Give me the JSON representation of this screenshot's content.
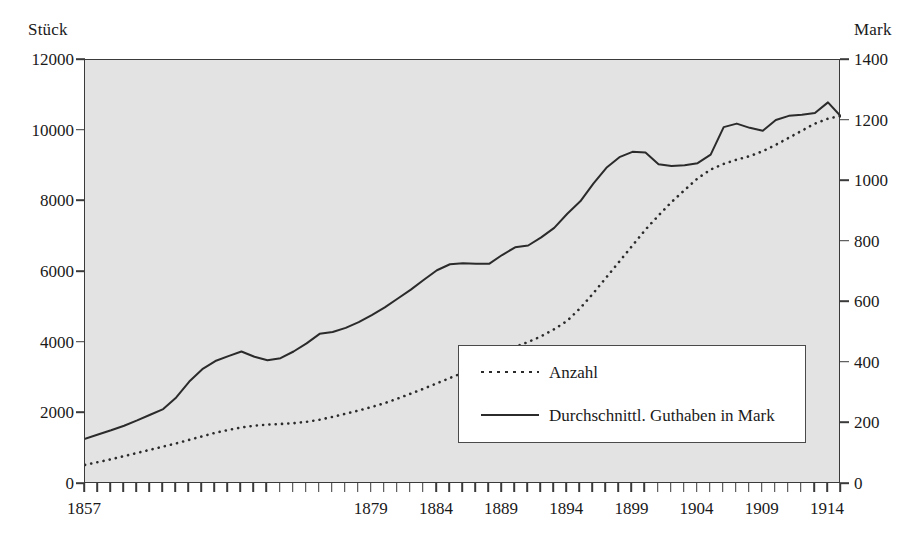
{
  "chart_data": {
    "type": "line",
    "title": "",
    "xlabel": "",
    "ylabel": "Stück",
    "y2label": "Mark",
    "grid": false,
    "legend_position": "inside-bottom-right",
    "xlim": [
      1857,
      1915
    ],
    "ylim": [
      0,
      12000
    ],
    "y2lim": [
      0,
      1400
    ],
    "yticks": [
      "0",
      "2000",
      "4000",
      "6000",
      "8000",
      "10000",
      "12000"
    ],
    "ytick_values": [
      0,
      2000,
      4000,
      6000,
      8000,
      10000,
      12000
    ],
    "y2ticks": [
      "0",
      "200",
      "400",
      "600",
      "800",
      "1000",
      "1200",
      "1400"
    ],
    "y2tick_values": [
      0,
      200,
      400,
      600,
      800,
      1000,
      1200,
      1400
    ],
    "xticks": [
      "1857",
      "1879",
      "1884",
      "1889",
      "1894",
      "1899",
      "1904",
      "1909",
      "1914"
    ],
    "xtick_values": [
      1857,
      1879,
      1884,
      1889,
      1894,
      1899,
      1904,
      1909,
      1914
    ],
    "x": [
      1857,
      1858,
      1859,
      1860,
      1861,
      1862,
      1863,
      1864,
      1865,
      1866,
      1867,
      1868,
      1869,
      1870,
      1871,
      1872,
      1873,
      1874,
      1875,
      1876,
      1877,
      1878,
      1879,
      1880,
      1881,
      1882,
      1883,
      1884,
      1885,
      1886,
      1887,
      1888,
      1889,
      1890,
      1891,
      1892,
      1893,
      1894,
      1895,
      1896,
      1897,
      1898,
      1899,
      1900,
      1901,
      1902,
      1903,
      1904,
      1905,
      1906,
      1907,
      1908,
      1909,
      1910,
      1911,
      1912,
      1913,
      1914,
      1915
    ],
    "series": [
      {
        "name": "Anzahl",
        "axis": "left",
        "style": "dotted",
        "color": "#2b2b2b",
        "unit": "Stück",
        "values": [
          540,
          620,
          700,
          790,
          880,
          970,
          1060,
          1150,
          1250,
          1350,
          1450,
          1530,
          1600,
          1650,
          1680,
          1700,
          1720,
          1760,
          1820,
          1900,
          1990,
          2080,
          2180,
          2290,
          2420,
          2560,
          2700,
          2850,
          3000,
          3150,
          3320,
          3500,
          3700,
          3880,
          4020,
          4180,
          4380,
          4620,
          4980,
          5400,
          5850,
          6300,
          6750,
          7200,
          7600,
          7980,
          8320,
          8650,
          8900,
          9060,
          9180,
          9280,
          9420,
          9600,
          9800,
          10000,
          10200,
          10340,
          10420
        ]
      },
      {
        "name": "Durchschnittl. Guthaben in Mark",
        "axis": "right",
        "style": "solid",
        "color": "#2b2b2b",
        "unit": "Mark",
        "values_stuck_scale": [
          1280,
          1400,
          1520,
          1650,
          1800,
          1960,
          2120,
          2450,
          2900,
          3250,
          3480,
          3620,
          3750,
          3600,
          3500,
          3560,
          3750,
          3980,
          4250,
          4300,
          4420,
          4580,
          4780,
          5000,
          5250,
          5500,
          5780,
          6050,
          6220,
          6250,
          6230,
          6230,
          6480,
          6700,
          6750,
          6980,
          7250,
          7650,
          8000,
          8500,
          8950,
          9250,
          9400,
          9380,
          9050,
          9000,
          9020,
          9080,
          9320,
          10100,
          10200,
          10080,
          10000,
          10300,
          10420,
          10450,
          10500,
          10800,
          10400
        ],
        "values": [
          149,
          163,
          177,
          193,
          210,
          229,
          247,
          286,
          338,
          379,
          406,
          422,
          437,
          420,
          408,
          415,
          437,
          464,
          496,
          502,
          516,
          534,
          558,
          583,
          613,
          642,
          674,
          706,
          726,
          729,
          727,
          727,
          756,
          782,
          788,
          814,
          846,
          892,
          933,
          992,
          1044,
          1079,
          1097,
          1094,
          1056,
          1050,
          1052,
          1059,
          1087,
          1178,
          1190,
          1176,
          1167,
          1202,
          1216,
          1219,
          1225,
          1260,
          1213
        ]
      }
    ]
  },
  "legend": {
    "items": [
      {
        "label": "Anzahl",
        "style": "dotted"
      },
      {
        "label": "Durchschnittl. Guthaben in Mark",
        "style": "solid"
      }
    ]
  },
  "colors": {
    "plot_background": "#e3e3e3",
    "axis": "#3a3a3a",
    "series": "#2b2b2b",
    "page_background": "#ffffff"
  }
}
